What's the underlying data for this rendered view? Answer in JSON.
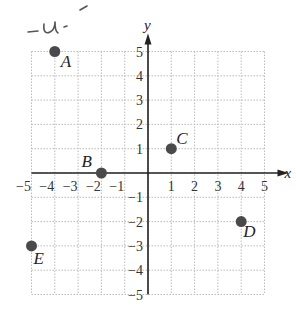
{
  "chart_data": {
    "type": "scatter",
    "title": "",
    "xlabel": "x",
    "ylabel": "y",
    "xlim": [
      -5,
      5
    ],
    "ylim": [
      -5,
      5
    ],
    "grid": true,
    "grid_style": "dotted",
    "x_ticks": [
      "-5",
      "-4",
      "-3",
      "-2",
      "-1",
      "1",
      "2",
      "3",
      "4",
      "5"
    ],
    "y_ticks": [
      "5",
      "4",
      "3",
      "2",
      "1",
      "-1",
      "-2",
      "-3",
      "-4",
      "-5"
    ],
    "points": [
      {
        "label": "A",
        "x": -4,
        "y": 5
      },
      {
        "label": "B",
        "x": -2,
        "y": 0
      },
      {
        "label": "C",
        "x": 1,
        "y": 1
      },
      {
        "label": "D",
        "x": 4,
        "y": -2
      },
      {
        "label": "E",
        "x": -5,
        "y": -3
      }
    ],
    "annotations": [
      "-u-"
    ],
    "colors": {
      "point": "#4a4a4a",
      "axis": "#222222",
      "grid": "#bbbbbb"
    }
  }
}
